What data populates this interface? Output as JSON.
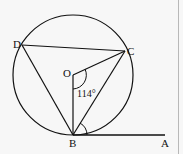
{
  "diagram": {
    "type": "circle-geometry",
    "colors": {
      "stroke": "#111111",
      "background": "#f7f7f7",
      "border": "#b8b8b8"
    },
    "circle": {
      "center_label": "O",
      "cx": 73,
      "cy": 75,
      "r": 60
    },
    "points": {
      "D": {
        "label": "D",
        "x": 22,
        "y": 45
      },
      "C": {
        "label": "C",
        "x": 125,
        "y": 51
      },
      "O": {
        "label": "O",
        "x": 73,
        "y": 75
      },
      "B": {
        "label": "B",
        "x": 73,
        "y": 135
      },
      "A": {
        "label": "A",
        "x": 163,
        "y": 135
      }
    },
    "segments": [
      "DC",
      "DB",
      "OC",
      "OB",
      "BC",
      "BA"
    ],
    "angle_label": "114°",
    "angle_marks": [
      "angle BOC",
      "angle CBA"
    ]
  }
}
